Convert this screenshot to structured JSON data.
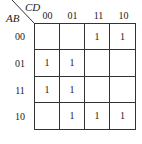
{
  "kmap": {
    "row_variable": "AB",
    "col_variable": "CD",
    "col_headers": [
      "00",
      "01",
      "11",
      "10"
    ],
    "row_headers": [
      "00",
      "01",
      "11",
      "10"
    ],
    "cells": [
      [
        "",
        "",
        "1",
        "1"
      ],
      [
        "1",
        "1",
        "",
        ""
      ],
      [
        "1",
        "1",
        "",
        ""
      ],
      [
        "",
        "1",
        "1",
        "1"
      ]
    ]
  }
}
